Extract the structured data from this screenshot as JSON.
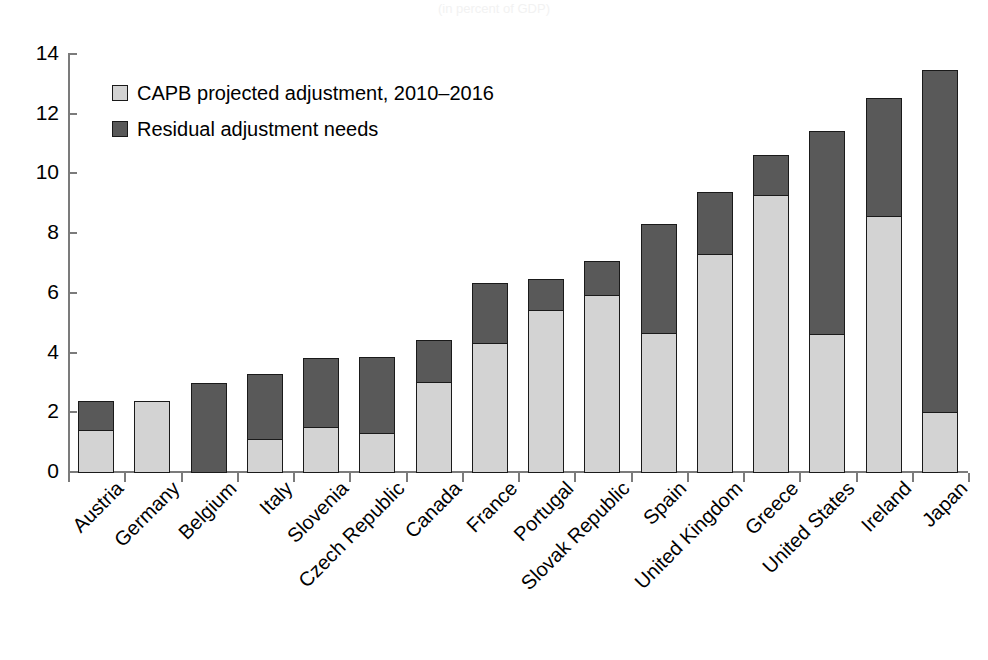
{
  "figure": {
    "title_remnant": "(in percent of GDP)"
  },
  "legend": {
    "position": "upper-left-inside",
    "items": [
      {
        "label": "CAPB projected adjustment, 2010–2016",
        "swatch": "light",
        "color": "#d3d3d3"
      },
      {
        "label": "Residual adjustment needs",
        "swatch": "dark",
        "color": "#595959"
      }
    ]
  },
  "axes": {
    "y_ticks": [
      "0",
      "2",
      "4",
      "6",
      "8",
      "10",
      "12",
      "14"
    ],
    "y_min": 0,
    "y_max": 14,
    "y_step": 2,
    "grid": false
  },
  "chart_data": {
    "type": "bar",
    "stacked": true,
    "title": "",
    "subtitle": "",
    "xlabel": "",
    "ylabel": "",
    "ylim": [
      0,
      14
    ],
    "ytick_step": 2,
    "grid": false,
    "legend_position": "upper left (inside plot)",
    "categories": [
      "Austria",
      "Germany",
      "Belgium",
      "Italy",
      "Slovenia",
      "Czech Republic",
      "Canada",
      "France",
      "Portugal",
      "Slovak Republic",
      "Spain",
      "United Kingdom",
      "Greece",
      "United States",
      "Ireland",
      "Japan"
    ],
    "series": [
      {
        "name": "CAPB projected adjustment, 2010–2016",
        "color": "#d3d3d3",
        "values": [
          1.45,
          2.4,
          0.1,
          1.15,
          1.55,
          1.35,
          3.05,
          4.35,
          5.45,
          5.95,
          4.7,
          7.35,
          9.3,
          4.65,
          8.6,
          2.05
        ]
      },
      {
        "name": "Residual adjustment needs",
        "color": "#595959",
        "values": [
          0.95,
          0.0,
          3.0,
          2.15,
          2.3,
          2.55,
          1.4,
          2.0,
          1.05,
          1.15,
          3.65,
          2.05,
          1.35,
          6.8,
          3.95,
          11.45
        ]
      }
    ],
    "totals": [
      2.4,
      2.4,
      3.1,
      3.3,
      3.85,
      3.9,
      4.45,
      6.35,
      6.5,
      7.1,
      8.35,
      9.4,
      10.65,
      11.45,
      12.55,
      13.5
    ]
  }
}
